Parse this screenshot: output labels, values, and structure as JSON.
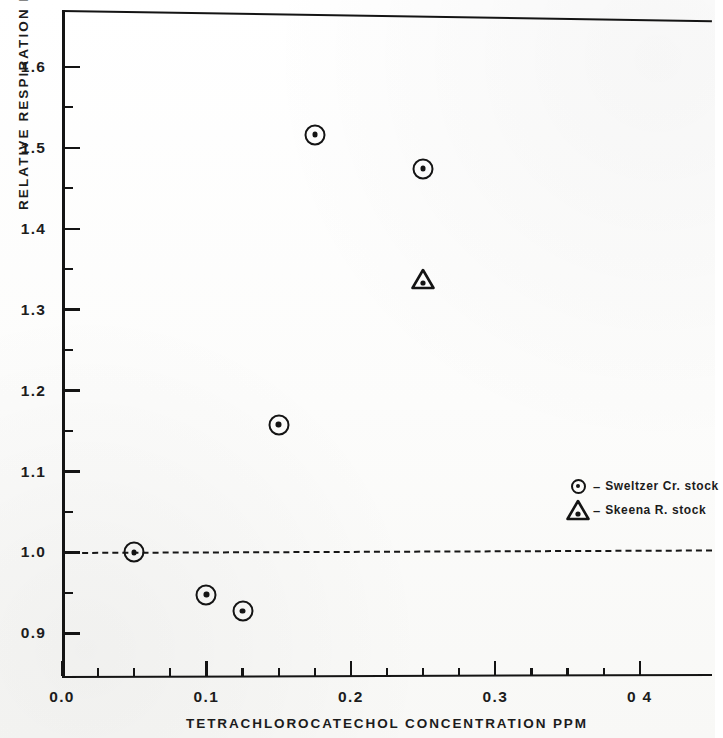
{
  "chart_data": {
    "type": "scatter",
    "title": "",
    "xlabel": "TETRACHLOROCATECHOL  CONCENTRATION  PPM",
    "ylabel": "RELATIVE  RESPIRATION  RATE",
    "xlim": [
      0.0,
      0.45
    ],
    "ylim": [
      0.845,
      1.67
    ],
    "grid": false,
    "legend_position": "center-right",
    "x_ticks": [
      {
        "value": 0.0,
        "label": "0.0",
        "major": true
      },
      {
        "value": 0.025,
        "label": "",
        "major": false
      },
      {
        "value": 0.05,
        "label": "",
        "major": false
      },
      {
        "value": 0.075,
        "label": "",
        "major": false
      },
      {
        "value": 0.1,
        "label": "0.1",
        "major": true
      },
      {
        "value": 0.125,
        "label": "",
        "major": false
      },
      {
        "value": 0.15,
        "label": "",
        "major": false
      },
      {
        "value": 0.175,
        "label": "",
        "major": false
      },
      {
        "value": 0.2,
        "label": "0.2",
        "major": true
      },
      {
        "value": 0.225,
        "label": "",
        "major": false
      },
      {
        "value": 0.25,
        "label": "",
        "major": false
      },
      {
        "value": 0.275,
        "label": "",
        "major": false
      },
      {
        "value": 0.3,
        "label": "0.3",
        "major": true
      },
      {
        "value": 0.325,
        "label": "",
        "major": false
      },
      {
        "value": 0.35,
        "label": "",
        "major": false
      },
      {
        "value": 0.375,
        "label": "",
        "major": false
      },
      {
        "value": 0.4,
        "label": "0 4",
        "major": true
      }
    ],
    "y_ticks": [
      {
        "value": 1.6,
        "label": "1.6",
        "major": true
      },
      {
        "value": 1.55,
        "label": "",
        "major": false
      },
      {
        "value": 1.5,
        "label": "1.5",
        "major": true
      },
      {
        "value": 1.45,
        "label": "",
        "major": false
      },
      {
        "value": 1.4,
        "label": "1.4",
        "major": true
      },
      {
        "value": 1.35,
        "label": "",
        "major": false
      },
      {
        "value": 1.3,
        "label": "1.3",
        "major": true
      },
      {
        "value": 1.25,
        "label": "",
        "major": false
      },
      {
        "value": 1.2,
        "label": "1.2",
        "major": true
      },
      {
        "value": 1.15,
        "label": "",
        "major": false
      },
      {
        "value": 1.1,
        "label": "1.1",
        "major": true
      },
      {
        "value": 1.05,
        "label": "",
        "major": false
      },
      {
        "value": 1.0,
        "label": "1.0",
        "major": true
      },
      {
        "value": 0.95,
        "label": "",
        "major": false
      },
      {
        "value": 0.9,
        "label": "0.9",
        "major": true
      }
    ],
    "reference_line": {
      "y": 1.0,
      "style": "dashed"
    },
    "series": [
      {
        "name": "Sweltzer Cr. stock",
        "marker": "circle-dot",
        "points": [
          {
            "x": 0.05,
            "y": 1.0
          },
          {
            "x": 0.1,
            "y": 0.948
          },
          {
            "x": 0.125,
            "y": 0.928
          },
          {
            "x": 0.15,
            "y": 1.158
          },
          {
            "x": 0.175,
            "y": 1.516
          },
          {
            "x": 0.25,
            "y": 1.474
          }
        ]
      },
      {
        "name": "Skeena R. stock",
        "marker": "triangle-dot",
        "points": [
          {
            "x": 0.25,
            "y": 1.338
          }
        ]
      }
    ]
  },
  "legend": {
    "entries": [
      {
        "dash": "–",
        "label": "Sweltzer  Cr. stock",
        "marker": "circle-dot"
      },
      {
        "dash": "–",
        "label": "Skeena  R. stock",
        "marker": "triangle-dot"
      }
    ]
  },
  "colors": {
    "ink": "#141414",
    "paper": "#fdfdfc"
  }
}
